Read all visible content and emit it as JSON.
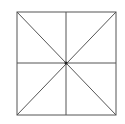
{
  "diagram": {
    "stroke_color": "#555555",
    "background": "#ffffff",
    "square": {
      "x1": 17,
      "y1": 12,
      "x2": 116,
      "y2": 115
    },
    "center": {
      "x": 66,
      "y": 63
    },
    "lines": [
      {
        "name": "diagonal-tl-br",
        "x1": 17,
        "y1": 12,
        "x2": 116,
        "y2": 115
      },
      {
        "name": "diagonal-tr-bl",
        "x1": 116,
        "y1": 12,
        "x2": 17,
        "y2": 115
      },
      {
        "name": "vertical-midline",
        "x1": 66,
        "y1": 12,
        "x2": 66,
        "y2": 115
      },
      {
        "name": "horizontal-midline",
        "x1": 17,
        "y1": 63,
        "x2": 116,
        "y2": 63
      }
    ]
  }
}
